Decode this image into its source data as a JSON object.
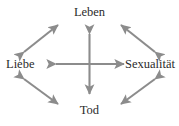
{
  "figure": {
    "background_color": "#ffffff",
    "arrow_color": "#8c8c8c",
    "text_color": "#2b2b2b"
  },
  "nodes": {
    "top": {
      "label": "Leben",
      "icon": "node-top"
    },
    "left": {
      "label": "Liebe",
      "icon": "node-left"
    },
    "right": {
      "label": "Sexualität",
      "icon": "node-right"
    },
    "bottom": {
      "label": "Tod",
      "icon": "node-bottom"
    }
  },
  "connectors": {
    "top_left": {
      "icon": "double-headed-arrow-diagonal-up-left"
    },
    "top_right": {
      "icon": "double-headed-arrow-diagonal-up-right"
    },
    "bottom_left": {
      "icon": "double-headed-arrow-diagonal-down-left"
    },
    "bottom_right": {
      "icon": "double-headed-arrow-diagonal-down-right"
    },
    "center_vertical": {
      "icon": "double-headed-arrow-vertical"
    },
    "center_horizontal": {
      "icon": "double-headed-arrow-horizontal"
    }
  }
}
